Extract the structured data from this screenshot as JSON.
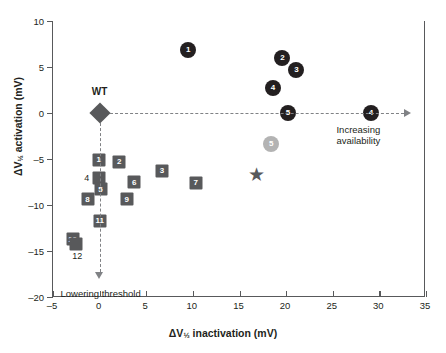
{
  "chart_data": {
    "type": "scatter",
    "title": "",
    "xlabel": "ΔV½ inactivation (mV)",
    "ylabel": "ΔV½ activation (mV)",
    "xlim": [
      -5,
      35
    ],
    "ylim": [
      -20,
      10
    ],
    "xticks": [
      -5,
      0,
      5,
      10,
      15,
      20,
      25,
      30,
      35
    ],
    "yticks": [
      -20,
      -15,
      -10,
      -5,
      0,
      5,
      10
    ],
    "grid": false,
    "legend": "none",
    "series": [
      {
        "name": "gain-of-function circles",
        "marker": "circle",
        "color": "#231f20",
        "points": [
          {
            "label": "1",
            "x": 9.5,
            "y": 6.8
          },
          {
            "label": "2",
            "x": 19.6,
            "y": 6.0
          },
          {
            "label": "3",
            "x": 21.1,
            "y": 4.7
          },
          {
            "label": "4",
            "x": 18.6,
            "y": 2.7
          },
          {
            "label": "5",
            "x": 20.2,
            "y": 0.0
          },
          {
            "label": "4",
            "x": 29.1,
            "y": 0.0
          }
        ]
      },
      {
        "name": "intermediate circle",
        "marker": "circle",
        "color": "#b3b3b3",
        "points": [
          {
            "label": "5",
            "x": 18.4,
            "y": -3.4
          }
        ]
      },
      {
        "name": "loss-of-function squares",
        "marker": "square",
        "color": "#58595b",
        "points": [
          {
            "label": "1",
            "x": -0.1,
            "y": -5.1
          },
          {
            "label": "2",
            "x": 2.1,
            "y": -5.3
          },
          {
            "label": "3",
            "x": 6.7,
            "y": -6.3
          },
          {
            "label": "4",
            "x": -0.1,
            "y": -7.1,
            "label_position": "left"
          },
          {
            "label": "5",
            "x": 0.1,
            "y": -8.3
          },
          {
            "label": "6",
            "x": 3.7,
            "y": -7.5
          },
          {
            "label": "7",
            "x": 10.3,
            "y": -7.6
          },
          {
            "label": "8",
            "x": -1.3,
            "y": -9.4
          },
          {
            "label": "9",
            "x": 2.9,
            "y": -9.4
          },
          {
            "label": "11",
            "x": 0.0,
            "y": -11.7
          },
          {
            "label": "10",
            "x": -2.9,
            "y": -13.7
          },
          {
            "label": "12",
            "x": -2.5,
            "y": -14.2,
            "label_position": "below"
          }
        ]
      },
      {
        "name": "wild type",
        "marker": "diamond",
        "color": "#58595b",
        "points": [
          {
            "label": "WT",
            "x": 0.0,
            "y": 0.0
          }
        ]
      },
      {
        "name": "unlabeled star",
        "marker": "star",
        "color": "#58595b",
        "points": [
          {
            "label": "",
            "x": 16.8,
            "y": -6.6
          }
        ]
      }
    ],
    "annotations": [
      {
        "text": "WT",
        "x": 0.0,
        "y": 0.0,
        "placement": "above-marker"
      },
      {
        "text": "Increasing\navailability",
        "x": 29.5,
        "y": -2.2,
        "arrow": "right"
      },
      {
        "text": "Lowering threshold",
        "x": 0.0,
        "y": -18.5,
        "arrow": "down"
      }
    ]
  },
  "axes": {
    "x_title_prefix": "ΔV",
    "x_title_sub": "½",
    "x_title_suffix": "inactivation (mV)",
    "y_title_prefix": "ΔV",
    "y_title_sub": "½",
    "y_title_suffix": "activation (mV)"
  },
  "annotations_text": {
    "wt": "WT",
    "increasing_line1": "Increasing",
    "increasing_line2": "availability",
    "lowering": "Lowering threshold"
  },
  "colors": {
    "dark_marker": "#231f20",
    "square_marker": "#58595b",
    "gray_marker": "#b3b3b3",
    "axis": "#58595b",
    "dashed": "#808285",
    "background": "#ffffff"
  }
}
